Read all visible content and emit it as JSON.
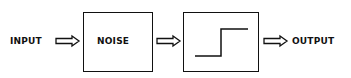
{
  "diagram": {
    "type": "block-diagram",
    "input_label": "INPUT",
    "noise_block_label": "NOISE",
    "threshold_block": "step-function",
    "output_label": "OUTPUT",
    "flow": [
      "INPUT",
      "NOISE",
      "step-function",
      "OUTPUT"
    ],
    "arrow_style": "hollow-double-line",
    "colors": {
      "stroke": "#111111",
      "background": "#ffffff"
    }
  }
}
